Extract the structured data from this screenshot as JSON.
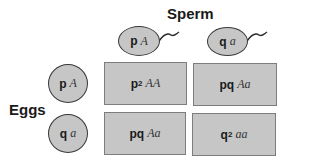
{
  "labels": {
    "sperm": "Sperm",
    "eggs": "Eggs"
  },
  "sperm": [
    {
      "freq": "p",
      "allele": "A"
    },
    {
      "freq": "q",
      "allele": "a"
    }
  ],
  "eggs": [
    {
      "freq": "p",
      "allele": "A"
    },
    {
      "freq": "q",
      "allele": "a"
    }
  ],
  "cells": [
    {
      "freq": "p",
      "exp": "2",
      "genotype": "AA"
    },
    {
      "freq": "pq",
      "exp": "",
      "genotype": "Aa"
    },
    {
      "freq": "pq",
      "exp": "",
      "genotype": "Aa"
    },
    {
      "freq": "q",
      "exp": "2",
      "genotype": "aa"
    }
  ],
  "colors": {
    "fill": "#c6c6c6",
    "cell_border": "#7d7d7d",
    "gamete_border": "#3a3a3a",
    "text": "#1a1a1a"
  }
}
